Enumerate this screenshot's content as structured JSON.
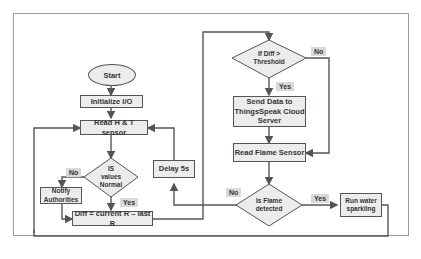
{
  "diagram": {
    "nodes": {
      "start": "Start",
      "init": "Initialize I/O",
      "read_ht": "Read H & T sensor",
      "is_normal": [
        "IS",
        "values",
        "Normal"
      ],
      "notify": [
        "Notify",
        "Authorities"
      ],
      "diff": "Diff = current R – last R",
      "delay": "Delay 5s",
      "threshold": [
        "If Diff >",
        "Threshold"
      ],
      "send": [
        "Send Data to",
        "ThingsSpeak Cloud",
        "Server"
      ],
      "read_flame": "Read Flame Sensor",
      "is_flame": [
        "Is Flame",
        "detected"
      ],
      "run_water": [
        "Run water",
        "sparkling"
      ]
    },
    "labels": {
      "normal_no": "No",
      "normal_yes": "Yes",
      "threshold_no": "No",
      "threshold_yes": "Yes",
      "flame_no": "No",
      "flame_yes": "Yes"
    },
    "colors": {
      "box_fill": "#ececec",
      "line": "#555555",
      "tag_fill": "#d9d9d9"
    }
  }
}
